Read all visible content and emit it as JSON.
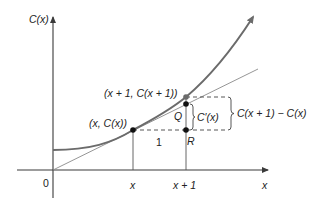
{
  "diagram": {
    "type": "marginal-cost-approximation",
    "colors": {
      "curve": "#6b6b6b",
      "axes": "#3a3a3a",
      "tangent": "#8a8a8a",
      "points": "#111111",
      "top_point": "#6b6b6b",
      "text": "#222222"
    },
    "axes": {
      "y_label": "C(x)",
      "x_label": "x",
      "origin_label": "0"
    },
    "ticks": {
      "x": "x",
      "x_plus_1": "x + 1"
    },
    "points": {
      "p1_label": "(x, C(x))",
      "p2_label": "(x + 1, C(x + 1))",
      "q_label": "Q",
      "r_label": "R"
    },
    "annotations": {
      "run_label": "1",
      "derivative_label": "C′(x)",
      "difference_label": "C(x + 1) − C(x)"
    }
  }
}
